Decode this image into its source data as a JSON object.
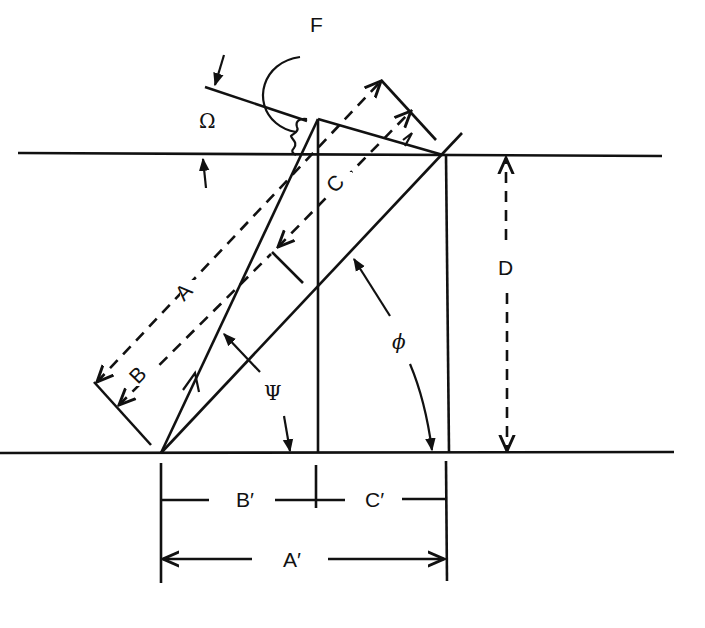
{
  "diagram": {
    "labels": {
      "F": "F",
      "omega": "Ω",
      "A": "A",
      "B": "B",
      "C": "C",
      "D": "D",
      "psi": "Ψ",
      "phi": "ϕ",
      "A_prime": "A′",
      "B_prime": "B′",
      "C_prime": "C′"
    },
    "colors": {
      "stroke": "#111111",
      "background": "#ffffff"
    }
  }
}
